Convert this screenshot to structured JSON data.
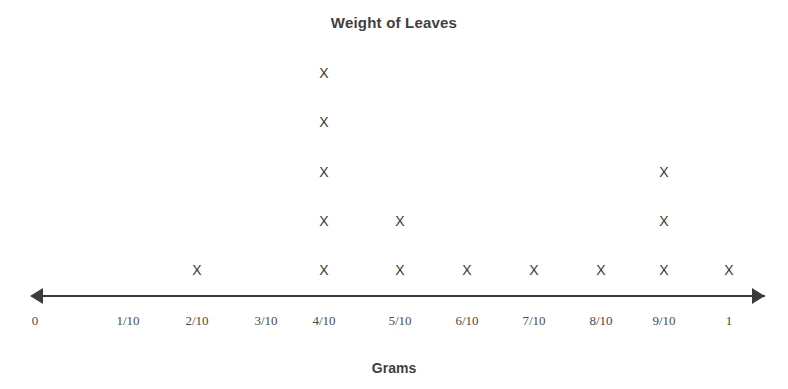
{
  "chart_data": {
    "type": "scatter",
    "plot_style": "dot-plot",
    "title": "Weight of Leaves",
    "xlabel": "Grams",
    "ylabel": "",
    "categories": [
      "0",
      "1/10",
      "2/10",
      "3/10",
      "4/10",
      "5/10",
      "6/10",
      "7/10",
      "8/10",
      "9/10",
      "1"
    ],
    "values": [
      0,
      0,
      1,
      0,
      5,
      2,
      1,
      1,
      1,
      3,
      1
    ],
    "x_numeric": [
      0,
      0.1,
      0.2,
      0.3,
      0.4,
      0.5,
      0.6,
      0.7,
      0.8,
      0.9,
      1.0
    ],
    "marker": "X",
    "xlim": [
      0,
      1
    ],
    "grid": false,
    "legend": null,
    "axis_arrows": "both",
    "total_count": 15
  },
  "axis": {
    "ticks": [
      {
        "label": "0",
        "x": 35
      },
      {
        "label": "1/10",
        "x": 128
      },
      {
        "label": "2/10",
        "x": 197
      },
      {
        "label": "3/10",
        "x": 266
      },
      {
        "label": "4/10",
        "x": 324
      },
      {
        "label": "5/10",
        "x": 400
      },
      {
        "label": "6/10",
        "x": 467
      },
      {
        "label": "7/10",
        "x": 534
      },
      {
        "label": "8/10",
        "x": 601
      },
      {
        "label": "9/10",
        "x": 664
      },
      {
        "label": "1",
        "x": 729
      }
    ],
    "line_color": "#3c3c3c"
  },
  "marks": [
    {
      "label": "X",
      "x": 197,
      "y": 263
    },
    {
      "label": "X",
      "x": 324,
      "y": 66
    },
    {
      "label": "X",
      "x": 324,
      "y": 115
    },
    {
      "label": "X",
      "x": 324,
      "y": 165
    },
    {
      "label": "X",
      "x": 324,
      "y": 214
    },
    {
      "label": "X",
      "x": 324,
      "y": 263
    },
    {
      "label": "X",
      "x": 400,
      "y": 214
    },
    {
      "label": "X",
      "x": 400,
      "y": 263
    },
    {
      "label": "X",
      "x": 467,
      "y": 263
    },
    {
      "label": "X",
      "x": 534,
      "y": 263
    },
    {
      "label": "X",
      "x": 601,
      "y": 263
    },
    {
      "label": "X",
      "x": 664,
      "y": 165
    },
    {
      "label": "X",
      "x": 664,
      "y": 214
    },
    {
      "label": "X",
      "x": 664,
      "y": 263
    },
    {
      "label": "X",
      "x": 729,
      "y": 263
    }
  ],
  "colors": {
    "mark": "#3a3a3a",
    "axis": "#3c3c3c",
    "text": "#3f3f3f",
    "background": "#ffffff"
  }
}
